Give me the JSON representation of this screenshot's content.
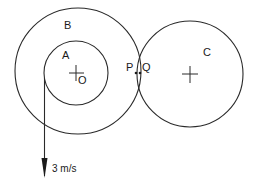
{
  "diagram": {
    "labels": {
      "circle_a": "A",
      "circle_b": "B",
      "circle_c": "C",
      "center_o": "O",
      "point_p": "P",
      "point_q": "Q",
      "velocity": "3 m/s"
    },
    "colors": {
      "stroke": "#2a2a2a",
      "background": "#ffffff"
    }
  }
}
